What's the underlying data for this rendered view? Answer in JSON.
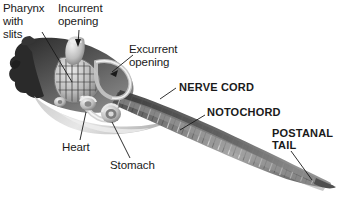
{
  "figure": {
    "organism": "tunicate larva",
    "background_color": "#ffffff",
    "ink_color": "#1a1a1a",
    "body_dark": "#3a3a3a",
    "body_mid": "#8c8c8c",
    "body_light": "#d8d8d8"
  },
  "labels": {
    "pharynx": {
      "text": "Pharynx\nwith\nslits",
      "style": "plain",
      "x": 3,
      "y": 3
    },
    "incurrent": {
      "text": "Incurrent\nopening",
      "style": "plain",
      "x": 58,
      "y": 3
    },
    "excurrent": {
      "text": "Excurrent\nopening",
      "style": "plain",
      "x": 129,
      "y": 44
    },
    "nerve_cord": {
      "text": "NERVE CORD",
      "style": "bold",
      "x": 179,
      "y": 85
    },
    "notochord": {
      "text": "NOTOCHORD",
      "style": "bold",
      "x": 207,
      "y": 110
    },
    "postanal_tail": {
      "text": "POSTANAL\nTAIL",
      "style": "bold",
      "x": 273,
      "y": 130
    },
    "heart": {
      "text": "Heart",
      "style": "plain",
      "x": 62,
      "y": 142
    },
    "stomach": {
      "text": "Stomach",
      "style": "plain",
      "x": 110,
      "y": 160
    }
  }
}
